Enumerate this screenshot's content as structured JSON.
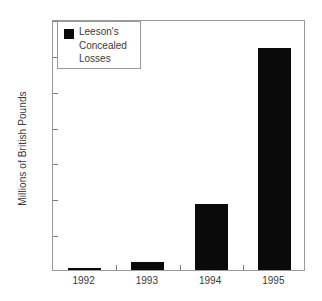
{
  "chart_data": {
    "type": "bar",
    "title": "",
    "subtitle": "",
    "xlabel": "",
    "ylabel": "Millions of British Pounds",
    "categories": [
      "1992",
      "1993",
      "1994",
      "1995"
    ],
    "values": [
      2,
      21,
      185,
      619
    ],
    "value_labels": [
      "2",
      "21",
      "185",
      "619"
    ],
    "series": [
      {
        "name": "Leeson's Concealed Losses",
        "values": [
          2,
          21,
          185,
          619
        ],
        "color": "#0a0a0a"
      }
    ],
    "ylim": [
      0,
      700
    ],
    "yticks": [
      0,
      100,
      200,
      300,
      400,
      500,
      600,
      700
    ],
    "ytick_labels": [
      "0",
      "100",
      "200",
      "300",
      "400",
      "500",
      "600",
      "700"
    ],
    "grid": false,
    "legend_position": "top-left"
  },
  "legend": {
    "label": "Leeson's\nConcealed\nLosses",
    "swatch_color": "#0a0a0a"
  },
  "axes": {
    "y_title": "Millions of British Pounds",
    "frame_color": "#9a9a9a",
    "tick_color": "#7d7d7d",
    "text_color": "#3a3a3a"
  }
}
